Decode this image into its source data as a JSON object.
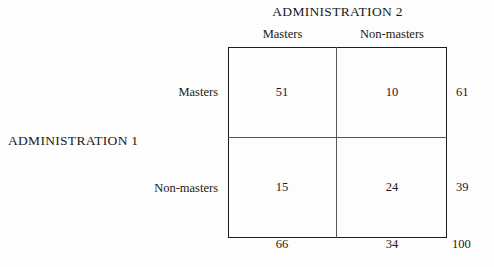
{
  "figure": {
    "type": "contingency-table",
    "column_variable_title": "ADMINISTRATION 2",
    "row_variable_title": "ADMINISTRATION 1",
    "column_headers": [
      "Masters",
      "Non-masters"
    ],
    "row_headers": [
      "Masters",
      "Non-masters"
    ],
    "cells": {
      "r1c1": "51",
      "r1c2": "10",
      "r2c1": "15",
      "r2c2": "24"
    },
    "row_totals": [
      "61",
      "39"
    ],
    "column_totals": [
      "66",
      "34"
    ],
    "grand_total": "100"
  },
  "chart_data": {
    "type": "table",
    "title": "ADMINISTRATION 2",
    "xlabel": "ADMINISTRATION 2",
    "ylabel": "ADMINISTRATION 1",
    "categories": [
      "Masters",
      "Non-masters"
    ],
    "rows": [
      "Masters",
      "Non-masters"
    ],
    "columns": [
      "Masters",
      "Non-masters"
    ],
    "values": [
      [
        51,
        10
      ],
      [
        15,
        24
      ]
    ],
    "row_margins": [
      61,
      39
    ],
    "column_margins": [
      66,
      34
    ],
    "grand_total": 100,
    "grid": true,
    "legend": "none"
  }
}
